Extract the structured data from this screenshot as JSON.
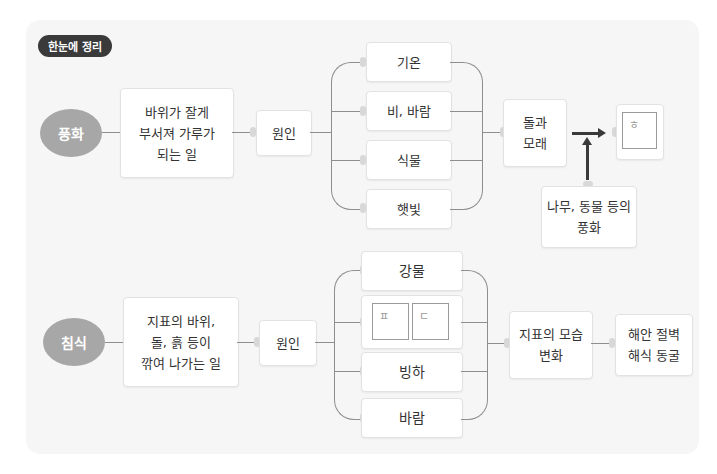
{
  "badge": "한눈에 정리",
  "colors": {
    "panel": "#f6f6f6",
    "oval": "#a7a7a7",
    "badge": "#3a3a3a",
    "line": "#8e8e8e"
  },
  "weathering": {
    "title": "풍화",
    "definition": "바위가 잘게\n부서져 가루가\n되는 일",
    "cause_label": "원인",
    "causes": [
      "기온",
      "비, 바람",
      "식물",
      "햇빛"
    ],
    "result": "돌과\n모래",
    "blank_label": "ㅎ",
    "extra": "나무, 동물 등의\n풍화"
  },
  "erosion": {
    "title": "침식",
    "definition": "지표의 바위,\n돌, 흙 등이\n깎여 나가는 일",
    "cause_label": "원인",
    "causes": [
      "강물",
      "",
      "빙하",
      "바람"
    ],
    "blank_labels": [
      "ㅍ",
      "ㄷ"
    ],
    "result": "지표의 모습\n변화",
    "examples": "해안 절벽\n해식 동굴"
  }
}
